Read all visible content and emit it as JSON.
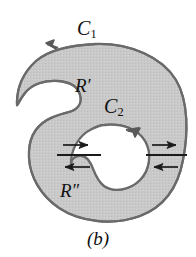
{
  "figure": {
    "caption": "(b)",
    "labels": {
      "outer_curve": {
        "base": "C",
        "sub": "1",
        "text": "C1"
      },
      "inner_curve": {
        "base": "C",
        "sub": "2",
        "text": "C2"
      },
      "upper_region": {
        "base": "R",
        "prime": "′",
        "text": "R′"
      },
      "lower_region": {
        "base": "R",
        "prime": "″",
        "text": "R″"
      }
    },
    "colors": {
      "region_fill": "#c8c8c8",
      "outline": "#555555",
      "arrow": "#4a4a4a",
      "crosscut_line": "#1a1a1a",
      "hole_fill": "#ffffff",
      "background": "#ffffff",
      "text": "#111111"
    },
    "orientation": {
      "outer_curve_direction": "counterclockwise",
      "inner_curve_direction": "clockwise",
      "upper_crosscut_arrow": "right",
      "lower_crosscut_arrow": "left"
    },
    "geometry": {
      "crosscut_upper_y": 148,
      "crosscut_lower_y": 163,
      "left_crosscut_x_range": [
        58,
        100
      ],
      "right_crosscut_x_range": [
        148,
        186
      ]
    }
  }
}
